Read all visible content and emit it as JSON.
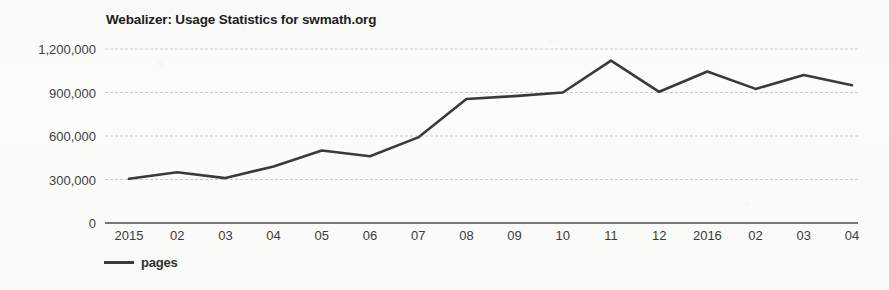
{
  "chart_data": {
    "type": "line",
    "title": "Webalizer: Usage Statistics for swmath.org",
    "xlabel": "",
    "ylabel": "",
    "grid": true,
    "legend_position": "bottom-left",
    "categories": [
      "2015",
      "02",
      "03",
      "04",
      "05",
      "06",
      "07",
      "08",
      "09",
      "10",
      "11",
      "12",
      "2016",
      "02",
      "03",
      "04"
    ],
    "ylim": [
      0,
      1200000
    ],
    "yticks": [
      0,
      300000,
      600000,
      900000,
      1200000
    ],
    "ytick_labels": [
      "0",
      "300,000",
      "600,000",
      "900,000",
      "1,200,000"
    ],
    "series": [
      {
        "name": "pages",
        "color": "#3a3a3a",
        "values": [
          305000,
          350000,
          310000,
          390000,
          500000,
          460000,
          590000,
          855000,
          875000,
          900000,
          1120000,
          905000,
          1045000,
          925000,
          1020000,
          950000
        ]
      }
    ]
  },
  "legend": {
    "items": [
      {
        "label": "pages",
        "color": "#3a3a3a"
      }
    ]
  },
  "colors": {
    "line": "#3a3a3a",
    "gridline": "#c9c9c9",
    "axis": "#4a4a4a",
    "background": "#fcfcfa",
    "text": "#2b2b2b"
  }
}
